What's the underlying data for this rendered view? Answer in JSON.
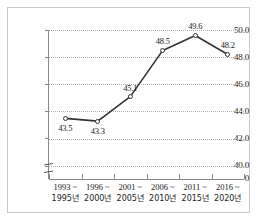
{
  "chart_data": {
    "type": "line",
    "title": "",
    "subtitle": "",
    "xlabel": "",
    "ylabel": "",
    "categories": [
      "1993~1995년",
      "1996~2000년",
      "2001~2005년",
      "2006~2010년",
      "2011~2015년",
      "2016~2020년"
    ],
    "category_lines": [
      {
        "line1": "1993 ~",
        "line2": "1995년"
      },
      {
        "line1": "1996 ~",
        "line2": "2000년"
      },
      {
        "line1": "2001 ~",
        "line2": "2005년"
      },
      {
        "line1": "2006 ~",
        "line2": "2010년"
      },
      {
        "line1": "2011 ~",
        "line2": "2015년"
      },
      {
        "line1": "2016 ~",
        "line2": "2020년"
      }
    ],
    "values": [
      43.5,
      43.3,
      45.1,
      48.5,
      49.6,
      48.2
    ],
    "point_labels": [
      "43.5",
      "43.3",
      "45.1",
      "48.5",
      "49.6",
      "48.2"
    ],
    "ylim": [
      40.0,
      50.0
    ],
    "yticks": [
      40.0,
      42.0,
      44.0,
      46.0,
      48.0,
      50.0
    ],
    "ytick_labels": [
      "40.0",
      "42.0",
      "44.0",
      "46.0",
      "48.0",
      "50.0"
    ],
    "y_zero_label": "0",
    "axis_break": true,
    "grid": true,
    "grid_style": "dotted",
    "legend": null,
    "series": [
      {
        "name": "",
        "values": [
          43.5,
          43.3,
          45.1,
          48.5,
          49.6,
          48.2
        ],
        "marker": "open-circle",
        "color": "#333333"
      }
    ]
  },
  "colors": {
    "line": "#333333",
    "grid": "#b0b0b0",
    "axis": "#888888",
    "frame": "#c8c8c8",
    "text": "#222222",
    "background": "#ffffff"
  }
}
